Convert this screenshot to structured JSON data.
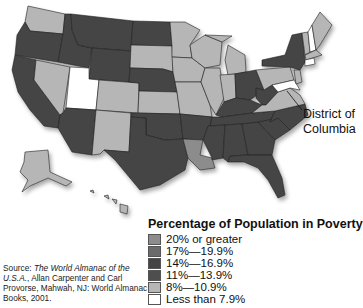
{
  "map": {
    "title": "Percentage of Population in Poverty",
    "callout_label": "District of Columbia",
    "legend": [
      {
        "label": "20% or greater",
        "color": "#8c8c8c"
      },
      {
        "label": "17%—19.9%",
        "color": "#6b6b6b"
      },
      {
        "label": "14%—16.9%",
        "color": "#444444"
      },
      {
        "label": "11%—13.9%",
        "color": "#4e4e4e"
      },
      {
        "label": "8%—10.9%",
        "color": "#b6b6b6"
      },
      {
        "label": "Less than 7.9%",
        "color": "#ffffff"
      }
    ],
    "source": {
      "prefix": "Source: ",
      "title": "The World Almanac of the U.S.A.",
      "rest": ", Allan Carpenter and Carl Provorse, Mahwah, NJ: World Almanac Books, 2001."
    }
  }
}
